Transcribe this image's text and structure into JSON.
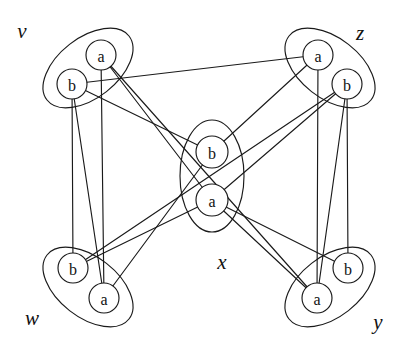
{
  "figure": {
    "width": 407,
    "height": 357,
    "background_color": "#ffffff",
    "ink_color": "#1a1a1a"
  },
  "clusters": [
    {
      "id": "v",
      "label": "v",
      "label_x": 22,
      "label_y": 31,
      "ellipse": {
        "cx": 88,
        "cy": 68,
        "rx": 52,
        "ry": 30,
        "rotation": -38
      },
      "nodes": [
        {
          "id": "v_a",
          "label": "a",
          "cx": 101,
          "cy": 55,
          "r": 15
        },
        {
          "id": "v_b",
          "label": "b",
          "cx": 72,
          "cy": 84,
          "r": 15
        }
      ]
    },
    {
      "id": "z",
      "label": "z",
      "label_x": 360,
      "label_y": 33,
      "ellipse": {
        "cx": 330,
        "cy": 68,
        "rx": 52,
        "ry": 30,
        "rotation": 38
      },
      "nodes": [
        {
          "id": "z_a",
          "label": "a",
          "cx": 318,
          "cy": 55,
          "r": 15
        },
        {
          "id": "z_b",
          "label": "b",
          "cx": 347,
          "cy": 84,
          "r": 15
        }
      ]
    },
    {
      "id": "x",
      "label": "x",
      "label_x": 222,
      "label_y": 262,
      "ellipse": {
        "cx": 212,
        "cy": 176,
        "rx": 32,
        "ry": 56,
        "rotation": 0
      },
      "nodes": [
        {
          "id": "x_b",
          "label": "b",
          "cx": 212,
          "cy": 152,
          "r": 16
        },
        {
          "id": "x_a",
          "label": "a",
          "cx": 212,
          "cy": 200,
          "r": 16
        }
      ]
    },
    {
      "id": "w",
      "label": "w",
      "label_x": 32,
      "label_y": 318,
      "ellipse": {
        "cx": 88,
        "cy": 287,
        "rx": 52,
        "ry": 30,
        "rotation": 38
      },
      "nodes": [
        {
          "id": "w_b",
          "label": "b",
          "cx": 73,
          "cy": 268,
          "r": 15
        },
        {
          "id": "w_a",
          "label": "a",
          "cx": 104,
          "cy": 298,
          "r": 15
        }
      ]
    },
    {
      "id": "y",
      "label": "y",
      "label_x": 378,
      "label_y": 322,
      "ellipse": {
        "cx": 330,
        "cy": 287,
        "rx": 52,
        "ry": 30,
        "rotation": -38
      },
      "nodes": [
        {
          "id": "y_b",
          "label": "b",
          "cx": 348,
          "cy": 268,
          "r": 15
        },
        {
          "id": "y_a",
          "label": "a",
          "cx": 317,
          "cy": 298,
          "r": 15
        }
      ]
    }
  ],
  "edges": [
    {
      "id": "e1",
      "from": "v_a",
      "to": "w_a",
      "x1": 101,
      "y1": 55,
      "x2": 104,
      "y2": 298
    },
    {
      "id": "e2",
      "from": "v_a",
      "to": "y_a",
      "x1": 101,
      "y1": 55,
      "x2": 317,
      "y2": 298
    },
    {
      "id": "e3",
      "from": "v_a",
      "to": "x_a",
      "x1": 101,
      "y1": 55,
      "x2": 212,
      "y2": 200
    },
    {
      "id": "e4",
      "from": "v_b",
      "to": "w_b",
      "x1": 72,
      "y1": 84,
      "x2": 73,
      "y2": 268
    },
    {
      "id": "e5",
      "from": "v_b",
      "to": "w_a",
      "x1": 72,
      "y1": 84,
      "x2": 104,
      "y2": 298
    },
    {
      "id": "e6",
      "from": "v_b",
      "to": "x_b",
      "x1": 72,
      "y1": 84,
      "x2": 212,
      "y2": 152
    },
    {
      "id": "e7",
      "from": "v_b",
      "to": "z_a",
      "x1": 72,
      "y1": 84,
      "x2": 318,
      "y2": 55
    },
    {
      "id": "e8",
      "from": "w_b",
      "to": "z_b",
      "x1": 73,
      "y1": 268,
      "x2": 347,
      "y2": 84
    },
    {
      "id": "e9",
      "from": "w_b",
      "to": "x_a",
      "x1": 73,
      "y1": 268,
      "x2": 212,
      "y2": 200
    },
    {
      "id": "e10",
      "from": "w_a",
      "to": "x_b",
      "x1": 104,
      "y1": 298,
      "x2": 212,
      "y2": 152
    },
    {
      "id": "e11",
      "from": "z_a",
      "to": "y_a",
      "x1": 318,
      "y1": 55,
      "x2": 317,
      "y2": 298
    },
    {
      "id": "e12",
      "from": "z_a",
      "to": "x_b",
      "x1": 318,
      "y1": 55,
      "x2": 212,
      "y2": 152
    },
    {
      "id": "e13",
      "from": "z_b",
      "to": "y_b",
      "x1": 347,
      "y1": 84,
      "x2": 348,
      "y2": 268
    },
    {
      "id": "e14",
      "from": "z_b",
      "to": "y_a",
      "x1": 347,
      "y1": 84,
      "x2": 317,
      "y2": 298
    },
    {
      "id": "e15",
      "from": "z_b",
      "to": "x_a",
      "x1": 347,
      "y1": 84,
      "x2": 212,
      "y2": 200
    },
    {
      "id": "e16",
      "from": "x_a",
      "to": "y_b",
      "x1": 212,
      "y1": 200,
      "x2": 348,
      "y2": 268
    },
    {
      "id": "e17",
      "from": "x_a",
      "to": "y_a",
      "x1": 212,
      "y1": 200,
      "x2": 317,
      "y2": 298
    }
  ]
}
